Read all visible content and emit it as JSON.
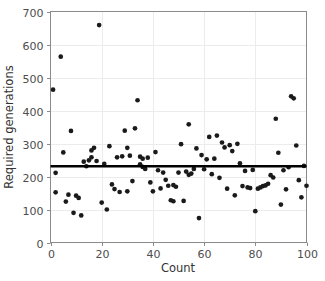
{
  "chart_data": {
    "type": "scatter",
    "title": "",
    "xlabel": "Count",
    "ylabel": "Required generations",
    "xlim": [
      0,
      100
    ],
    "ylim": [
      0,
      700
    ],
    "xticks": [
      0,
      20,
      40,
      60,
      80,
      100
    ],
    "yticks": [
      0,
      100,
      200,
      300,
      400,
      500,
      600,
      700
    ],
    "grid": true,
    "legend": "none",
    "marker_color": "#1a1a1a",
    "trendline": {
      "type": "horizontal-mean-line",
      "color": "#000000",
      "value": 231,
      "x_start": 0,
      "x_end": 100
    },
    "x": [
      1,
      2,
      2,
      4,
      5,
      6,
      7,
      8,
      9,
      10,
      11,
      12,
      13,
      14,
      15,
      16,
      16,
      17,
      18,
      19,
      20,
      21,
      22,
      23,
      24,
      25,
      26,
      27,
      28,
      29,
      30,
      30,
      31,
      32,
      33,
      34,
      35,
      35,
      36,
      36,
      37,
      38,
      39,
      40,
      41,
      42,
      43,
      44,
      45,
      46,
      47,
      48,
      48,
      49,
      50,
      51,
      52,
      53,
      54,
      54,
      55,
      56,
      57,
      58,
      59,
      60,
      61,
      62,
      63,
      64,
      65,
      66,
      67,
      68,
      69,
      70,
      71,
      72,
      73,
      74,
      75,
      76,
      77,
      78,
      79,
      80,
      81,
      82,
      83,
      84,
      85,
      86,
      87,
      88,
      89,
      90,
      91,
      92,
      93,
      94,
      95,
      96,
      97,
      98,
      99,
      100
    ],
    "y": [
      463,
      152,
      211,
      563,
      273,
      124,
      145,
      338,
      90,
      142,
      135,
      82,
      245,
      231,
      249,
      279,
      258,
      287,
      247,
      659,
      121,
      238,
      100,
      292,
      176,
      162,
      258,
      153,
      261,
      339,
      287,
      155,
      263,
      186,
      346,
      431,
      260,
      237,
      254,
      229,
      223,
      257,
      182,
      155,
      274,
      219,
      164,
      212,
      190,
      172,
      128,
      174,
      125,
      169,
      212,
      298,
      126,
      215,
      358,
      205,
      209,
      223,
      285,
      74,
      265,
      222,
      252,
      320,
      207,
      254,
      324,
      196,
      303,
      288,
      163,
      295,
      277,
      143,
      299,
      240,
      171,
      217,
      167,
      165,
      220,
      95,
      163,
      167,
      171,
      173,
      178,
      204,
      197,
      375,
      272,
      115,
      219,
      161,
      228,
      443,
      437,
      294,
      189,
      137,
      232,
      172
    ],
    "n_points": 106
  },
  "axes": {
    "x_tick_labels": [
      "0",
      "20",
      "40",
      "60",
      "80",
      "100"
    ],
    "y_tick_labels": [
      "0",
      "100",
      "200",
      "300",
      "400",
      "500",
      "600",
      "700"
    ],
    "x_axis_title": "Count",
    "y_axis_title": "Required generations"
  }
}
